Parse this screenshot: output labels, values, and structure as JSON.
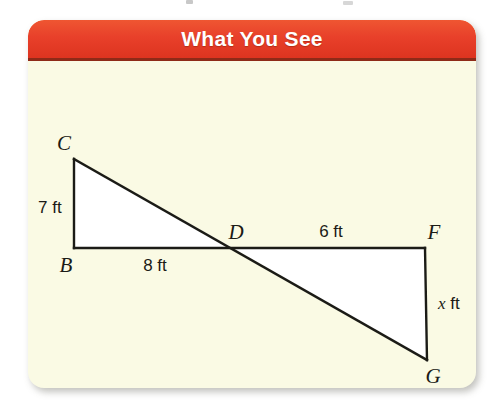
{
  "card": {
    "header_title": "What You See",
    "header_color": "#e8402a",
    "body_color": "#fafae4",
    "stroke_color": "#1b1b16"
  },
  "figure": {
    "caption": "Two right triangles BCD and DFG meeting at point D, drawn back to back",
    "vertices": [
      {
        "name": "C",
        "label": "C",
        "x": 74,
        "y": 139
      },
      {
        "name": "B",
        "label": "B",
        "x": 74,
        "y": 228
      },
      {
        "name": "D",
        "label": "D",
        "x": 233,
        "y": 228
      },
      {
        "name": "F",
        "label": "F",
        "x": 425,
        "y": 228
      },
      {
        "name": "G",
        "label": "G",
        "x": 427,
        "y": 340
      }
    ],
    "measures": [
      {
        "name": "cb-length",
        "text": "7 ft",
        "side": "CB"
      },
      {
        "name": "bd-length",
        "text": "8 ft",
        "side": "BD"
      },
      {
        "name": "df-length",
        "text": "6 ft",
        "side": "DF"
      },
      {
        "name": "fg-length",
        "text": "x ft",
        "side": "FG",
        "variable": "x",
        "unit": "ft"
      }
    ]
  }
}
